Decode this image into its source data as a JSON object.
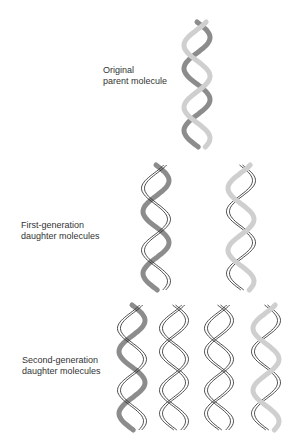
{
  "figure": {
    "topic": "Semiconservative DNA replication",
    "labels": {
      "parent": [
        "Original",
        "parent molecule"
      ],
      "first_gen": [
        "First-generation",
        "daughter molecules"
      ],
      "second_gen": [
        "Second-generation",
        "daughter molecules"
      ]
    },
    "colors": {
      "old_strand_dark": "#8c8c8c",
      "old_strand_light": "#cfcfcf",
      "new_strand_outline": "#222222",
      "background": "#ffffff"
    },
    "generations": [
      {
        "name": "parent",
        "molecules": [
          {
            "cx": 197,
            "top": 22,
            "strands": [
              "old-dark",
              "old-light"
            ]
          }
        ]
      },
      {
        "name": "first",
        "molecules": [
          {
            "cx": 156,
            "top": 165,
            "strands": [
              "old-dark",
              "new"
            ]
          },
          {
            "cx": 241,
            "top": 165,
            "strands": [
              "new",
              "old-light"
            ]
          }
        ]
      },
      {
        "name": "second",
        "molecules": [
          {
            "cx": 132,
            "top": 305,
            "strands": [
              "old-dark",
              "new"
            ]
          },
          {
            "cx": 174,
            "top": 305,
            "strands": [
              "new",
              "new"
            ]
          },
          {
            "cx": 219,
            "top": 305,
            "strands": [
              "new",
              "new"
            ]
          },
          {
            "cx": 266,
            "top": 305,
            "strands": [
              "new",
              "old-light"
            ]
          }
        ]
      }
    ]
  }
}
